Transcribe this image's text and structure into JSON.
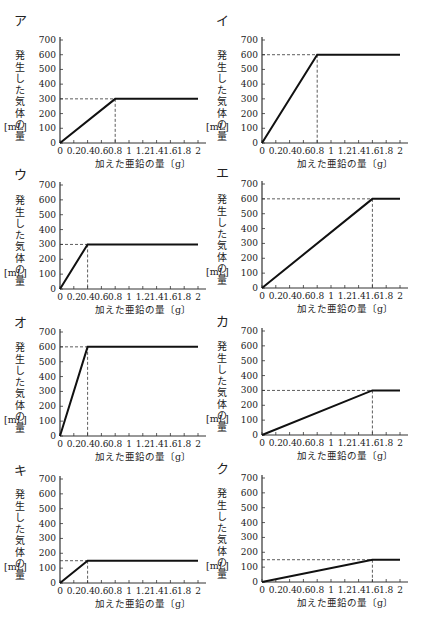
{
  "axis": {
    "ylabel_chars": [
      "発",
      "生",
      "し",
      "た",
      "気",
      "体",
      "の",
      "量"
    ],
    "yunit": "[mL]",
    "xlabel": "加えた亜鉛の量〔g〕",
    "xticks": [
      "0",
      "0.2",
      "0.4",
      "0.6",
      "0.8",
      "1",
      "1.2",
      "1.4",
      "1.6",
      "1.8",
      "2"
    ],
    "yticks": [
      "0",
      "100",
      "200",
      "300",
      "400",
      "500",
      "600",
      "700"
    ]
  },
  "chart_data": [
    {
      "type": "line",
      "label": "ア",
      "title": "ア",
      "xlabel": "加えた亜鉛の量〔g〕",
      "ylabel": "発生した気体の量〔mL〕",
      "xlim": [
        0,
        2
      ],
      "ylim": [
        0,
        700
      ],
      "x": [
        0,
        0.8,
        2
      ],
      "y": [
        0,
        300,
        300
      ],
      "dashed_at": {
        "x": 0.8,
        "y": 300
      }
    },
    {
      "type": "line",
      "label": "イ",
      "title": "イ",
      "xlabel": "加えた亜鉛の量〔g〕",
      "ylabel": "発生した気体の量〔mL〕",
      "xlim": [
        0,
        2
      ],
      "ylim": [
        0,
        700
      ],
      "x": [
        0,
        0.8,
        2
      ],
      "y": [
        0,
        600,
        600
      ],
      "dashed_at": {
        "x": 0.8,
        "y": 600
      }
    },
    {
      "type": "line",
      "label": "ウ",
      "title": "ウ",
      "xlabel": "加えた亜鉛の量〔g〕",
      "ylabel": "発生した気体の量〔mL〕",
      "xlim": [
        0,
        2
      ],
      "ylim": [
        0,
        700
      ],
      "x": [
        0,
        0.4,
        2
      ],
      "y": [
        0,
        300,
        300
      ],
      "dashed_at": {
        "x": 0.4,
        "y": 300
      }
    },
    {
      "type": "line",
      "label": "エ",
      "title": "エ",
      "xlabel": "加えた亜鉛の量〔g〕",
      "ylabel": "発生した気体の量〔mL〕",
      "xlim": [
        0,
        2
      ],
      "ylim": [
        0,
        700
      ],
      "x": [
        0,
        1.6,
        2
      ],
      "y": [
        0,
        600,
        600
      ],
      "dashed_at": {
        "x": 1.6,
        "y": 600
      }
    },
    {
      "type": "line",
      "label": "オ",
      "title": "オ",
      "xlabel": "加えた亜鉛の量〔g〕",
      "ylabel": "発生した気体の量〔mL〕",
      "xlim": [
        0,
        2
      ],
      "ylim": [
        0,
        700
      ],
      "x": [
        0,
        0.4,
        2
      ],
      "y": [
        0,
        600,
        600
      ],
      "dashed_at": {
        "x": 0.4,
        "y": 600
      }
    },
    {
      "type": "line",
      "label": "カ",
      "title": "カ",
      "xlabel": "加えた亜鉛の量〔g〕",
      "ylabel": "発生した気体の量〔mL〕",
      "xlim": [
        0,
        2
      ],
      "ylim": [
        0,
        700
      ],
      "x": [
        0,
        1.6,
        2
      ],
      "y": [
        0,
        300,
        300
      ],
      "dashed_at": {
        "x": 1.6,
        "y": 300
      }
    },
    {
      "type": "line",
      "label": "キ",
      "title": "キ",
      "xlabel": "加えた亜鉛の量〔g〕",
      "ylabel": "発生した気体の量〔mL〕",
      "xlim": [
        0,
        2
      ],
      "ylim": [
        0,
        700
      ],
      "x": [
        0,
        0.4,
        2
      ],
      "y": [
        0,
        150,
        150
      ],
      "dashed_at": {
        "x": 0.4,
        "y": 150
      }
    },
    {
      "type": "line",
      "label": "ク",
      "title": "ク",
      "xlabel": "加えた亜鉛の量〔g〕",
      "ylabel": "発生した気体の量〔mL〕",
      "xlim": [
        0,
        2
      ],
      "ylim": [
        0,
        700
      ],
      "x": [
        0,
        1.6,
        2
      ],
      "y": [
        0,
        150,
        150
      ],
      "dashed_at": {
        "x": 1.6,
        "y": 150
      }
    }
  ]
}
